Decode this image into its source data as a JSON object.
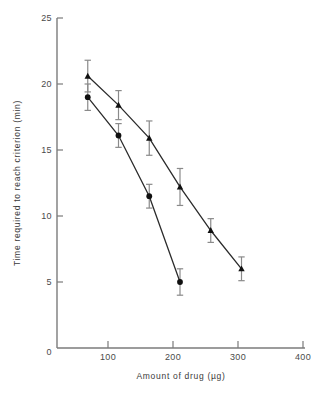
{
  "chart_data": {
    "type": "line",
    "title": "",
    "xlabel": "Amount of drug (µg)",
    "ylabel": "Time required to reach criterion (min)",
    "xlim": [
      0,
      400
    ],
    "ylim": [
      0,
      25
    ],
    "xticks": [
      0,
      100,
      200,
      300,
      400
    ],
    "xticklabels": [
      "0",
      "100",
      "200",
      "300",
      "400"
    ],
    "yticks": [
      0,
      5,
      10,
      15,
      20,
      25
    ],
    "yticklabels": [
      "0",
      "5",
      "10",
      "15",
      "20",
      "25"
    ],
    "grid": false,
    "legend": "none",
    "series": [
      {
        "name": "triangle-series",
        "marker": "triangle",
        "x": [
          50,
          100,
          150,
          200,
          250,
          300
        ],
        "values": [
          20.6,
          18.4,
          15.9,
          12.2,
          8.9,
          6.0
        ],
        "errors": [
          1.2,
          1.1,
          1.3,
          1.4,
          0.9,
          0.9
        ]
      },
      {
        "name": "circle-series",
        "marker": "circle",
        "x": [
          50,
          100,
          150,
          200
        ],
        "values": [
          19.0,
          16.1,
          11.5,
          5.0
        ],
        "errors": [
          1.0,
          0.9,
          0.9,
          1.0
        ]
      }
    ]
  },
  "axes": {
    "x_title": "Amount of drug (µg)",
    "y_title": "Time required to reach criterion (min)",
    "x_tick_0": "0",
    "x_tick_1": "100",
    "x_tick_2": "200",
    "x_tick_3": "300",
    "x_tick_4": "400",
    "y_tick_0": "0",
    "y_tick_1": "5",
    "y_tick_2": "10",
    "y_tick_3": "15",
    "y_tick_4": "20",
    "y_tick_5": "25"
  },
  "colors": {
    "marker": "#101010",
    "line": "#2b2b2b",
    "axis": "#7b7b7b",
    "errorbar": "#8a8a8a",
    "background": "#ffffff"
  }
}
